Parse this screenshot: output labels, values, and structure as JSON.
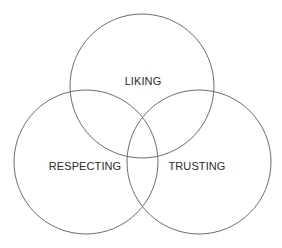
{
  "diagram": {
    "type": "venn",
    "sets": [
      {
        "id": "liking",
        "label": "LIKING",
        "cx": 142,
        "cy": 86,
        "r": 72,
        "label_x": 143,
        "label_y": 82
      },
      {
        "id": "respecting",
        "label": "RESPECTING",
        "cx": 86,
        "cy": 162,
        "r": 72,
        "label_x": 85,
        "label_y": 167
      },
      {
        "id": "trusting",
        "label": "TRUSTING",
        "cx": 199,
        "cy": 162,
        "r": 72,
        "label_x": 197,
        "label_y": 167
      }
    ],
    "stroke_color": "#6e6e6e",
    "label_color": "#2b2b2b",
    "background": "#ffffff"
  }
}
